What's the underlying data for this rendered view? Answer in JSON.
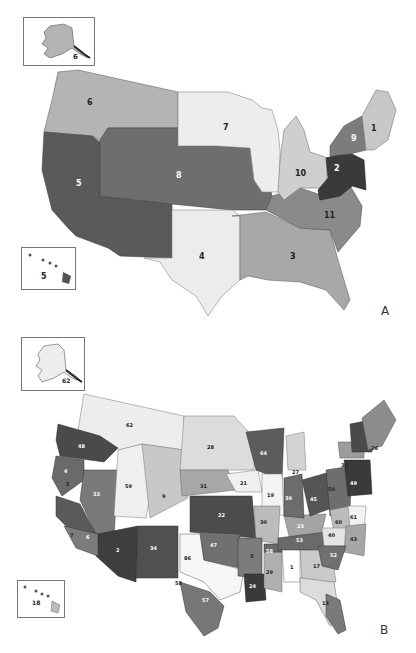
{
  "figure": {
    "panels": [
      {
        "id": "A",
        "letter": "A",
        "inset_alaska_label": "6",
        "inset_hawaii_label": "5",
        "regions": [
          {
            "label": "1",
            "region": "New England",
            "fill": "#c8c8c8",
            "text": "#222"
          },
          {
            "label": "2",
            "region": "Mid-Atlantic",
            "fill": "#3a3a3a",
            "text": "#fff"
          },
          {
            "label": "3",
            "region": "Southeast",
            "fill": "#a8a8a8",
            "text": "#222"
          },
          {
            "label": "4",
            "region": "South Central",
            "fill": "#ececec",
            "text": "#222"
          },
          {
            "label": "5",
            "region": "Southwest/Pacific",
            "fill": "#5a5a5a",
            "text": "#fff"
          },
          {
            "label": "6",
            "region": "Northwest",
            "fill": "#b4b4b4",
            "text": "#222"
          },
          {
            "label": "7",
            "region": "Upper Midwest",
            "fill": "#ededed",
            "text": "#222"
          },
          {
            "label": "8",
            "region": "Central Plains",
            "fill": "#6e6e6e",
            "text": "#fff"
          },
          {
            "label": "9",
            "region": "New York",
            "fill": "#7c7c7c",
            "text": "#fff"
          },
          {
            "label": "10",
            "region": "Great Lakes",
            "fill": "#cfcfcf",
            "text": "#222"
          },
          {
            "label": "11",
            "region": "Mid-South",
            "fill": "#8a8a8a",
            "text": "#222"
          }
        ]
      },
      {
        "id": "B",
        "letter": "B",
        "inset_alaska_label": "62",
        "inset_hawaii_label": "18",
        "district_labels": [
          "62",
          "48",
          "4",
          "5",
          "33",
          "59",
          "9",
          "28",
          "31",
          "21",
          "19",
          "64",
          "27",
          "22",
          "30",
          "39",
          "45",
          "50",
          "49",
          "36",
          "26",
          "2",
          "34",
          "86",
          "47",
          "3",
          "58",
          "23",
          "53",
          "60",
          "61",
          "40",
          "43",
          "52",
          "1",
          "17",
          "29",
          "24",
          "58",
          "57",
          "7",
          "6",
          "13"
        ]
      }
    ],
    "caption": ""
  }
}
